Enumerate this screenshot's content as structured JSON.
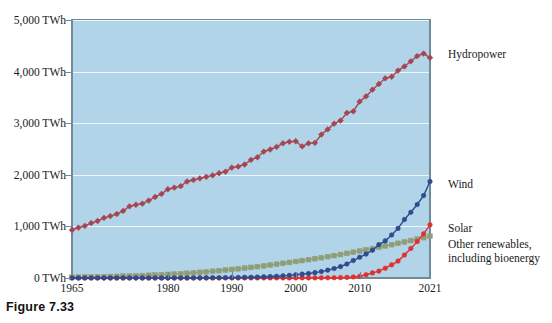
{
  "caption": "Figure 7.33",
  "chart_data": {
    "type": "line",
    "title": "",
    "xlabel": "",
    "ylabel": "",
    "xlim": [
      1965,
      2021
    ],
    "ylim": [
      0,
      5000
    ],
    "grid": true,
    "legend_position": "right-inline",
    "plot_background": "#b2d4e8",
    "y_ticks": [
      {
        "value": 0,
        "label": "0 TWh"
      },
      {
        "value": 1000,
        "label": "1,000 TWh"
      },
      {
        "value": 2000,
        "label": "2,000 TWh"
      },
      {
        "value": 3000,
        "label": "3,000 TWh"
      },
      {
        "value": 4000,
        "label": "4,000 TWh"
      },
      {
        "value": 5000,
        "label": "5,000 TWh"
      }
    ],
    "x_ticks": [
      {
        "value": 1965,
        "label": "1965"
      },
      {
        "value": 1980,
        "label": "1980"
      },
      {
        "value": 1990,
        "label": "1990"
      },
      {
        "value": 2000,
        "label": "2000"
      },
      {
        "value": 2010,
        "label": "2010"
      },
      {
        "value": 2021,
        "label": "2021"
      }
    ],
    "x": [
      1965,
      1966,
      1967,
      1968,
      1969,
      1970,
      1971,
      1972,
      1973,
      1974,
      1975,
      1976,
      1977,
      1978,
      1979,
      1980,
      1981,
      1982,
      1983,
      1984,
      1985,
      1986,
      1987,
      1988,
      1989,
      1990,
      1991,
      1992,
      1993,
      1994,
      1995,
      1996,
      1997,
      1998,
      1999,
      2000,
      2001,
      2002,
      2003,
      2004,
      2005,
      2006,
      2007,
      2008,
      2009,
      2010,
      2011,
      2012,
      2013,
      2014,
      2015,
      2016,
      2017,
      2018,
      2019,
      2020,
      2021
    ],
    "series": [
      {
        "name": "Hydropower",
        "color": "#a64452",
        "marker": "diamond",
        "label": "Hydropower",
        "values": [
          930,
          975,
          1010,
          1065,
          1105,
          1165,
          1200,
          1240,
          1300,
          1390,
          1420,
          1440,
          1500,
          1570,
          1630,
          1720,
          1750,
          1780,
          1870,
          1900,
          1930,
          1960,
          1990,
          2030,
          2060,
          2140,
          2160,
          2200,
          2290,
          2340,
          2450,
          2490,
          2540,
          2610,
          2640,
          2650,
          2550,
          2610,
          2620,
          2780,
          2880,
          2990,
          3050,
          3200,
          3230,
          3420,
          3520,
          3650,
          3760,
          3870,
          3900,
          4020,
          4100,
          4200,
          4300,
          4350,
          4270
        ]
      },
      {
        "name": "Wind",
        "color": "#2e4b8f",
        "marker": "circle",
        "label": "Wind",
        "values": [
          0,
          0,
          0,
          0,
          0,
          0,
          0,
          0,
          0,
          0,
          0,
          0,
          0,
          0,
          0,
          0,
          0,
          0,
          0,
          1,
          2,
          3,
          4,
          5,
          6,
          8,
          10,
          12,
          15,
          19,
          24,
          28,
          34,
          42,
          51,
          63,
          75,
          88,
          104,
          124,
          152,
          183,
          221,
          271,
          339,
          402,
          463,
          538,
          646,
          719,
          834,
          961,
          1134,
          1273,
          1424,
          1598,
          1870
        ]
      },
      {
        "name": "Solar",
        "color": "#e03030",
        "marker": "circle",
        "label": "Solar",
        "values": [
          0,
          0,
          0,
          0,
          0,
          0,
          0,
          0,
          0,
          0,
          0,
          0,
          0,
          0,
          0,
          0,
          0,
          0,
          0,
          0,
          0,
          0,
          0,
          0,
          0,
          0,
          0,
          0,
          0,
          0,
          1,
          1,
          1,
          1,
          1,
          1,
          2,
          2,
          2,
          3,
          4,
          5,
          7,
          12,
          20,
          32,
          64,
          99,
          134,
          190,
          255,
          328,
          445,
          573,
          705,
          855,
          1030
        ]
      },
      {
        "name": "Other renewables, including bioenergy",
        "color": "#8f9e78",
        "marker": "square",
        "label": "Other renewables,\nincluding bioenergy",
        "values": [
          15,
          17,
          19,
          21,
          24,
          26,
          29,
          32,
          36,
          40,
          44,
          48,
          53,
          58,
          64,
          70,
          77,
          84,
          92,
          101,
          110,
          120,
          131,
          142,
          154,
          166,
          179,
          192,
          206,
          221,
          236,
          252,
          268,
          285,
          302,
          320,
          338,
          356,
          375,
          394,
          414,
          434,
          455,
          477,
          499,
          522,
          546,
          570,
          595,
          620,
          646,
          672,
          699,
          726,
          754,
          782,
          810
        ]
      }
    ],
    "series_labels": [
      {
        "name": "Hydropower",
        "lines": [
          "Hydropower"
        ],
        "x": 448,
        "y": 48
      },
      {
        "name": "Wind",
        "lines": [
          "Wind"
        ],
        "x": 448,
        "y": 178
      },
      {
        "name": "Solar",
        "lines": [
          "Solar"
        ],
        "x": 448,
        "y": 222
      },
      {
        "name": "Other renewables, including bioenergy",
        "lines": [
          "Other renewables,",
          "including bioenergy"
        ],
        "x": 448,
        "y": 238
      }
    ]
  }
}
